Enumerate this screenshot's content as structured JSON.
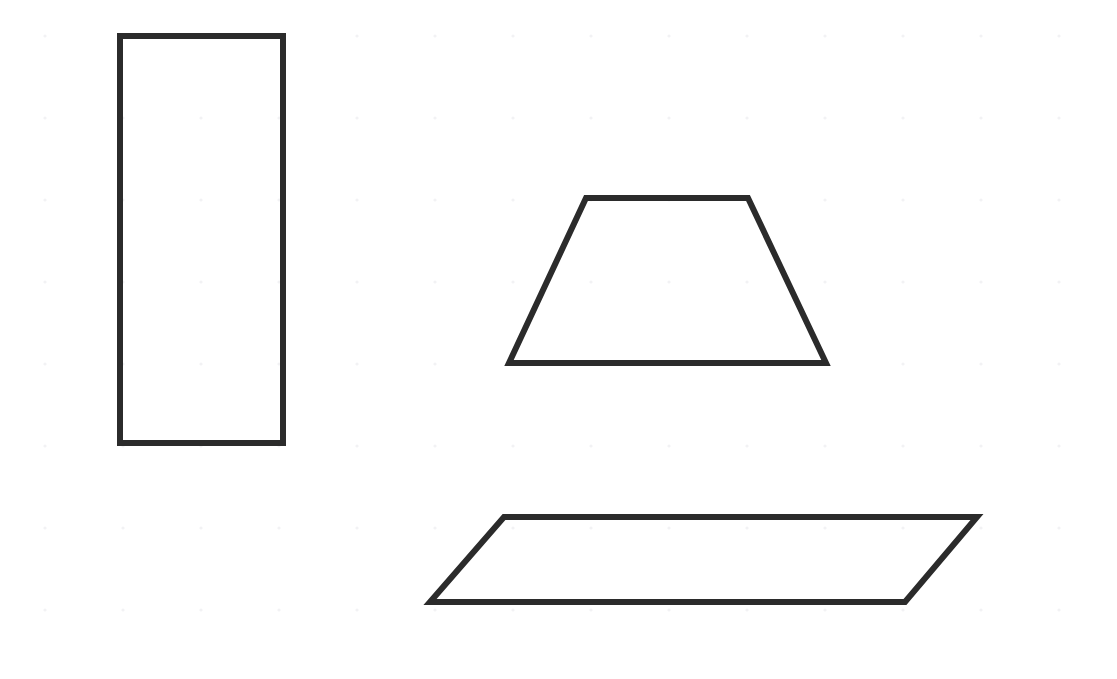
{
  "canvas": {
    "width": 1117,
    "height": 679,
    "background_color": "#ffffff",
    "title": "Geometric Shapes Diagram"
  },
  "grid": {
    "visible": true,
    "kind": "dot-grid",
    "dot_color": "#f2f2f4",
    "dot_radius": 1.6,
    "spacing_x": 78,
    "spacing_y": 82,
    "offset_x": 45,
    "offset_y": 36
  },
  "style": {
    "stroke_color": "#2b2b2b",
    "stroke_width": 6,
    "fill": "none"
  },
  "shapes": [
    {
      "id": "rectangle",
      "name": "rectangle",
      "label": "Rectangle",
      "sides": 4,
      "points": "120,36 283,36 283,443 120,443",
      "bbox": {
        "x": 120,
        "y": 36,
        "width": 163,
        "height": 407
      },
      "vertices": [
        {
          "x": 120,
          "y": 36
        },
        {
          "x": 283,
          "y": 36
        },
        {
          "x": 283,
          "y": 443
        },
        {
          "x": 120,
          "y": 443
        }
      ]
    },
    {
      "id": "trapezoid",
      "name": "trapezoid",
      "label": "Trapezoid",
      "sides": 4,
      "points": "586,198 748,198 826,363 509,363",
      "bbox": {
        "x": 509,
        "y": 198,
        "width": 317,
        "height": 165
      },
      "vertices": [
        {
          "x": 586,
          "y": 198
        },
        {
          "x": 748,
          "y": 198
        },
        {
          "x": 826,
          "y": 363
        },
        {
          "x": 509,
          "y": 363
        }
      ]
    },
    {
      "id": "parallelogram",
      "name": "parallelogram",
      "label": "Parallelogram",
      "sides": 4,
      "points": "504,517 977,517 905,602 430,602",
      "bbox": {
        "x": 430,
        "y": 517,
        "width": 547,
        "height": 85
      },
      "vertices": [
        {
          "x": 504,
          "y": 517
        },
        {
          "x": 977,
          "y": 517
        },
        {
          "x": 905,
          "y": 602
        },
        {
          "x": 430,
          "y": 602
        }
      ]
    }
  ]
}
